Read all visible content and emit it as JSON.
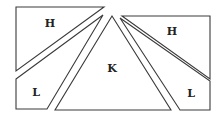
{
  "diagram": {
    "pieces": [
      {
        "id": "left-top",
        "label": "H"
      },
      {
        "id": "left-bottom",
        "label": "L"
      },
      {
        "id": "center",
        "label": "K"
      },
      {
        "id": "right-top",
        "label": "H"
      },
      {
        "id": "right-bottom",
        "label": "L"
      }
    ]
  }
}
